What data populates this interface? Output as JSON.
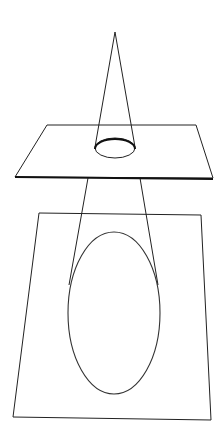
{
  "diagram": {
    "colors": {
      "background": "#ffffff",
      "stroke": "#222222"
    },
    "cone": {
      "apex": [
        115,
        32
      ],
      "base_left": [
        95,
        147
      ],
      "base_right": [
        135,
        147
      ]
    },
    "upper_plane": {
      "points": [
        [
          47,
          125
        ],
        [
          196,
          125
        ],
        [
          213,
          178
        ],
        [
          15,
          177
        ]
      ]
    },
    "small_ellipse": {
      "cx": 115,
      "cy": 148,
      "rx": 20,
      "ry": 10
    },
    "projection_lines": [
      {
        "from": [
          88,
          178
        ],
        "to": [
          70,
          280
        ]
      },
      {
        "from": [
          140,
          178
        ],
        "to": [
          157,
          282
        ]
      }
    ],
    "lower_plane": {
      "points": [
        [
          39,
          213
        ],
        [
          201,
          215
        ],
        [
          211,
          420
        ],
        [
          13,
          417
        ]
      ]
    },
    "large_ellipse": {
      "cx": 114,
      "cy": 313,
      "rx": 46,
      "ry": 81
    }
  }
}
